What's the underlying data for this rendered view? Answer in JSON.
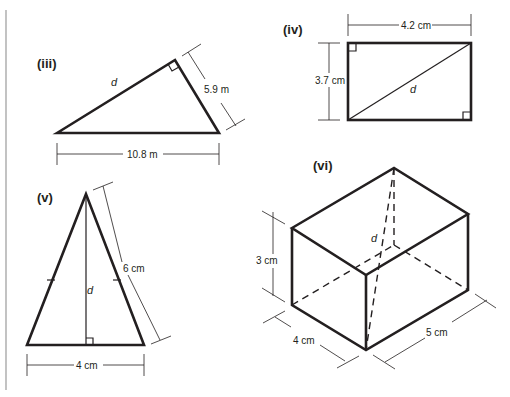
{
  "figures": {
    "iii": {
      "label": "(iii)",
      "shape": "right triangle",
      "hypotenuse_label": "d",
      "side_label": "5.9 m",
      "base_label": "10.8 m"
    },
    "iv": {
      "label": "(iv)",
      "shape": "rectangle with diagonal",
      "width_label": "4.2 cm",
      "height_label": "3.7 cm",
      "diagonal_label": "d"
    },
    "v": {
      "label": "(v)",
      "shape": "isosceles triangle with altitude",
      "side_label": "6 cm",
      "base_label": "4 cm",
      "altitude_label": "d"
    },
    "vi": {
      "label": "(vi)",
      "shape": "cuboid with space diagonal",
      "height_label": "3 cm",
      "depth_label": "4 cm",
      "length_label": "5 cm",
      "diagonal_label": "d"
    }
  },
  "colors": {
    "ink": "#231f20",
    "margin_line": "#9a9a9a",
    "background": "#ffffff"
  }
}
